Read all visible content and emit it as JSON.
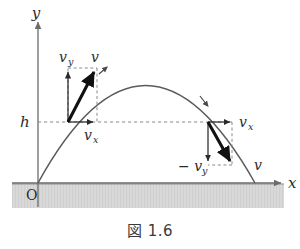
{
  "figure": {
    "caption": "図 1.6",
    "axes": {
      "x_label": "x",
      "y_label": "y",
      "origin_label": "O"
    },
    "height_marker": {
      "label": "h"
    },
    "ascending_point": {
      "velocity_label": "v",
      "vertical_component_label": "v",
      "vertical_component_sub": "y",
      "horizontal_component_label": "v",
      "horizontal_component_sub": "x"
    },
    "descending_point": {
      "velocity_label": "v",
      "vertical_component_label": "− v",
      "vertical_component_sub": "y",
      "horizontal_component_label": "v",
      "horizontal_component_sub": "x"
    },
    "colors": {
      "curve": "#5a5a5a",
      "axis": "#6b6b6b",
      "vector": "#1a1a1a",
      "dashed": "#8a8a8a",
      "ground_fill": "#d8d8d8",
      "ground_line": "#8f8f8f",
      "text": "#2b2b2b"
    }
  }
}
